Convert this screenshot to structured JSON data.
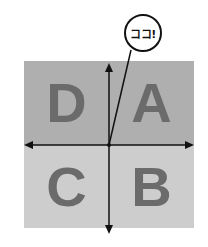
{
  "diagram": {
    "quadrants": [
      {
        "position": "top-left",
        "label": "D",
        "color": "#afafaf"
      },
      {
        "position": "top-right",
        "label": "A",
        "color": "#afafaf"
      },
      {
        "position": "bottom-left",
        "label": "C",
        "color": "#cdcdcd"
      },
      {
        "position": "bottom-right",
        "label": "B",
        "color": "#cdcdcd"
      }
    ],
    "callout": {
      "text": "ココ!"
    },
    "axes": {
      "horizontal": "double-arrow",
      "vertical": "double-arrow"
    }
  }
}
